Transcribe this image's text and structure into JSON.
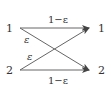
{
  "diagram": {
    "type": "binary-symmetric-channel",
    "inputs": [
      {
        "label": "1"
      },
      {
        "label": "2"
      }
    ],
    "outputs": [
      {
        "label": "1"
      },
      {
        "label": "2"
      }
    ],
    "edges": [
      {
        "from": "1",
        "to": "1",
        "label": "1−ε"
      },
      {
        "from": "1",
        "to": "2",
        "label": "ε"
      },
      {
        "from": "2",
        "to": "1",
        "label": "ε"
      },
      {
        "from": "2",
        "to": "2",
        "label": "1−ε"
      }
    ],
    "colors": {
      "line": "#555555",
      "text": "#333333",
      "background": "#ffffff"
    }
  }
}
